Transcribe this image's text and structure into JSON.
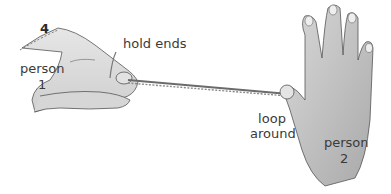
{
  "figure": {
    "step_number": "4",
    "labels": {
      "hold_ends": "hold ends",
      "person1_line1": "person",
      "person1_line2": "1",
      "loop_line1": "loop",
      "loop_line2": "around",
      "person2_line1": "person",
      "person2_line2": "2"
    },
    "colors": {
      "background": "#ffffff",
      "ink": "#3a3a3a",
      "skin_shade": "#bdbdbd",
      "string": "#6b6b6b"
    }
  }
}
